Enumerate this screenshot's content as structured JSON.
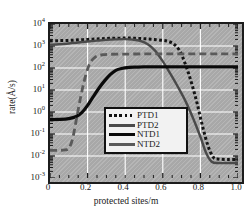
{
  "chart_data": {
    "type": "line",
    "title": "",
    "xlabel": "protected sites/m",
    "ylabel": "rate(Å/s)",
    "xlim": [
      0,
      1.0
    ],
    "ylim": [
      0.001,
      10000
    ],
    "yscale": "log",
    "xscale": "linear",
    "grid": true,
    "grid_color": "#ffffff",
    "panel_color": "#a8a8a8",
    "legend_position": "center",
    "xticks": [
      {
        "value": 0,
        "label": "0"
      },
      {
        "value": 0.2,
        "label": "0.2"
      },
      {
        "value": 0.4,
        "label": "0.4"
      },
      {
        "value": 0.6,
        "label": "0.6"
      },
      {
        "value": 0.8,
        "label": "0.8"
      },
      {
        "value": 1.0,
        "label": "1.0"
      }
    ],
    "yticks": [
      {
        "value": 0.001,
        "mantissa": "10",
        "exponent": "-3"
      },
      {
        "value": 0.01,
        "mantissa": "10",
        "exponent": "-2"
      },
      {
        "value": 0.1,
        "mantissa": "10",
        "exponent": "-1"
      },
      {
        "value": 1,
        "mantissa": "10",
        "exponent": "0"
      },
      {
        "value": 10,
        "mantissa": "10",
        "exponent": "1"
      },
      {
        "value": 100,
        "mantissa": "10",
        "exponent": "2"
      },
      {
        "value": 1000,
        "mantissa": "10",
        "exponent": "3"
      },
      {
        "value": 10000,
        "mantissa": "10",
        "exponent": "4"
      }
    ],
    "series": [
      {
        "name": "PTD1",
        "style": "dotted",
        "color": "#141414",
        "width": 3.0,
        "x": [
          0.0,
          0.05,
          0.1,
          0.15,
          0.2,
          0.25,
          0.3,
          0.35,
          0.4,
          0.45,
          0.5,
          0.55,
          0.6,
          0.63,
          0.66,
          0.69,
          0.72,
          0.75,
          0.78,
          0.81,
          0.84,
          0.87,
          0.9,
          0.95,
          1.0
        ],
        "y": [
          1700,
          1750,
          1800,
          1900,
          2000,
          2100,
          2200,
          2250,
          2300,
          2250,
          2150,
          2000,
          1800,
          1600,
          1200,
          600,
          150,
          25,
          3,
          0.25,
          0.03,
          0.0085,
          0.0072,
          0.007,
          0.007
        ]
      },
      {
        "name": "PTD2",
        "style": "solid",
        "color": "#4a4a4a",
        "width": 2.4,
        "x": [
          0.0,
          0.05,
          0.1,
          0.15,
          0.2,
          0.25,
          0.3,
          0.35,
          0.4,
          0.44,
          0.48,
          0.52,
          0.56,
          0.6,
          0.64,
          0.68,
          0.72,
          0.76,
          0.8,
          0.83,
          0.86,
          0.9,
          0.95,
          1.0
        ],
        "y": [
          1150,
          1200,
          1300,
          1450,
          1600,
          1750,
          1900,
          2000,
          2050,
          1950,
          1700,
          1200,
          600,
          200,
          55,
          14,
          3.2,
          0.55,
          0.075,
          0.014,
          0.0055,
          0.0048,
          0.0048,
          0.0048
        ]
      },
      {
        "name": "NTD1",
        "style": "solid",
        "color": "#0a0a0a",
        "width": 3.2,
        "x": [
          0.0,
          0.05,
          0.1,
          0.14,
          0.17,
          0.2,
          0.23,
          0.26,
          0.29,
          0.32,
          0.35,
          0.38,
          0.42,
          0.46,
          0.5,
          0.6,
          0.7,
          0.8,
          0.9,
          1.0
        ],
        "y": [
          0.45,
          0.46,
          0.5,
          0.62,
          0.95,
          2.0,
          5.0,
          12,
          26,
          50,
          78,
          95,
          107,
          110,
          112,
          113,
          113,
          113,
          113,
          113
        ]
      },
      {
        "name": "NTD2",
        "style": "dashed",
        "color": "#5a5a5a",
        "width": 2.8,
        "x": [
          0.0,
          0.04,
          0.08,
          0.1,
          0.12,
          0.14,
          0.16,
          0.18,
          0.2,
          0.22,
          0.24,
          0.26,
          0.28,
          0.32,
          0.4,
          0.5,
          0.6,
          0.7,
          0.8,
          0.9,
          1.0
        ],
        "y": [
          0.018,
          0.018,
          0.019,
          0.022,
          0.06,
          0.45,
          3.5,
          22,
          90,
          210,
          310,
          370,
          400,
          420,
          430,
          435,
          438,
          440,
          440,
          440,
          440
        ]
      }
    ]
  },
  "legend": {
    "items": [
      {
        "label": "PTD1",
        "sample": "dotted-line-sample"
      },
      {
        "label": "PTD2",
        "sample": "thin-solid-line-sample"
      },
      {
        "label": "NTD1",
        "sample": "thick-solid-line-sample"
      },
      {
        "label": "NTD2",
        "sample": "dashed-line-sample"
      }
    ]
  }
}
